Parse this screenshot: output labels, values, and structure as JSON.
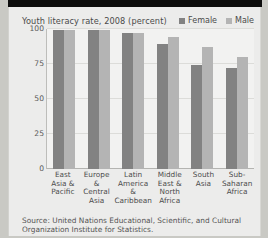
{
  "chart_data": {
    "type": "bar",
    "title": "Youth literacy rate, 2008 (percent)",
    "xlabel": "",
    "ylabel": "",
    "ylim": [
      0,
      100
    ],
    "yticks": [
      100,
      75,
      50,
      25,
      0
    ],
    "grid": true,
    "legend_position": "top-right",
    "categories": [
      "East Asia & Pacific",
      "Europe & Central Asia",
      "Latin America & Caribbean",
      "Middle East & North Africa",
      "South Asia",
      "Sub-Saharan Africa"
    ],
    "category_lines": [
      [
        "East",
        "Asia &",
        "Pacific"
      ],
      [
        "Europe &",
        "Central",
        "Asia"
      ],
      [
        "Latin",
        "America &",
        "Caribbean"
      ],
      [
        "Middle",
        "East &",
        "North",
        "Africa"
      ],
      [
        "South",
        "Asia"
      ],
      [
        "Sub-",
        "Saharan",
        "Africa"
      ]
    ],
    "series": [
      {
        "name": "Female",
        "color": "#828282",
        "values": [
          99,
          99,
          97,
          89,
          74,
          72
        ]
      },
      {
        "name": "Male",
        "color": "#b4b4b4",
        "values": [
          99,
          99,
          97,
          94,
          87,
          80
        ]
      }
    ]
  },
  "legend": {
    "items": [
      {
        "label": "Female",
        "color": "#828282"
      },
      {
        "label": "Male",
        "color": "#b4b4b4"
      }
    ]
  },
  "source": {
    "text": "Source: United Nations Educational, Scientific, and Cultural Organization Institute for Statistics."
  }
}
